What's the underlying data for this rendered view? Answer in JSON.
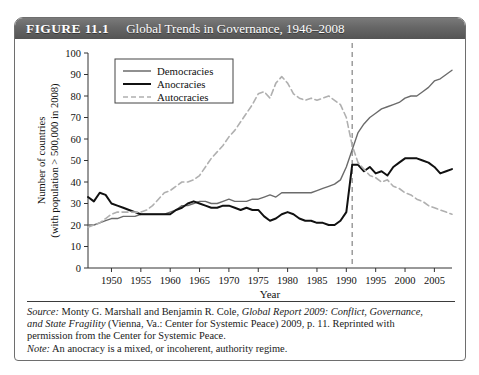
{
  "figure": {
    "number": "FIGURE 11.1",
    "title": "Global Trends in Governance, 1946–2008"
  },
  "caption": {
    "source_label": "Source:",
    "source_part1": " Monty G. Marshall and Benjamin R. Cole, ",
    "source_italic1": "Global Report 2009: Conflict, Governance,",
    "source_italic2": "and State Fragility",
    "source_part2": " (Vienna, Va.: Center for Systemic Peace) 2009, p. 11. Reprinted with",
    "source_part3": "permission from the Center for Systemic Peace.",
    "note_label": "Note:",
    "note_text": " An anocracy is a mixed, or incoherent, authority regime."
  },
  "chart_data": {
    "type": "line",
    "title": "Global Trends in Governance, 1946–2008",
    "xlabel": "Year",
    "ylabel": "Number of countries (with population > 500,000 in 2008)",
    "ylabel_line1": "Number of countries",
    "ylabel_line2": "(with population > 500,000 in 2008)",
    "xlim": [
      1946,
      2008
    ],
    "ylim": [
      0,
      100
    ],
    "yticks": [
      0,
      10,
      20,
      30,
      40,
      50,
      60,
      70,
      80,
      90,
      100
    ],
    "xticks": [
      1950,
      1955,
      1960,
      1965,
      1970,
      1975,
      1980,
      1985,
      1990,
      1995,
      2000,
      2005
    ],
    "grid": false,
    "legend_position": "top-left",
    "annotations": [
      {
        "type": "vline",
        "x": 1991,
        "style": "dashed",
        "color": "#8c8c8c"
      }
    ],
    "x": [
      1946,
      1947,
      1948,
      1949,
      1950,
      1951,
      1952,
      1953,
      1954,
      1955,
      1956,
      1957,
      1958,
      1959,
      1960,
      1961,
      1962,
      1963,
      1964,
      1965,
      1966,
      1967,
      1968,
      1969,
      1970,
      1971,
      1972,
      1973,
      1974,
      1975,
      1976,
      1977,
      1978,
      1979,
      1980,
      1981,
      1982,
      1983,
      1984,
      1985,
      1986,
      1987,
      1988,
      1989,
      1990,
      1991,
      1992,
      1993,
      1994,
      1995,
      1996,
      1997,
      1998,
      1999,
      2000,
      2001,
      2002,
      2003,
      2004,
      2005,
      2006,
      2007,
      2008
    ],
    "series": [
      {
        "name": "Democracies",
        "color": "#6b6b6b",
        "style": "solid",
        "width": 1.4,
        "values": [
          20,
          20,
          21,
          22,
          23,
          23,
          24,
          24,
          24,
          25,
          25,
          25,
          25,
          25,
          26,
          27,
          29,
          29,
          30,
          31,
          31,
          30,
          30,
          31,
          32,
          31,
          31,
          31,
          32,
          32,
          33,
          34,
          33,
          35,
          35,
          35,
          35,
          35,
          35,
          36,
          37,
          38,
          39,
          41,
          47,
          55,
          63,
          67,
          70,
          72,
          74,
          75,
          76,
          77,
          79,
          80,
          80,
          82,
          84,
          87,
          88,
          90,
          92
        ]
      },
      {
        "name": "Anocracies",
        "color": "#111111",
        "style": "solid",
        "width": 2.0,
        "values": [
          33,
          31,
          35,
          34,
          30,
          29,
          28,
          27,
          26,
          25,
          25,
          25,
          25,
          25,
          25,
          27,
          28,
          30,
          31,
          30,
          29,
          28,
          28,
          29,
          29,
          28,
          27,
          28,
          27,
          27,
          24,
          22,
          23,
          25,
          26,
          25,
          23,
          22,
          22,
          21,
          21,
          20,
          20,
          22,
          26,
          48,
          48,
          45,
          47,
          44,
          45,
          43,
          47,
          49,
          51,
          51,
          51,
          50,
          49,
          47,
          44,
          45,
          46
        ]
      },
      {
        "name": "Autocracies",
        "color": "#b0b0b0",
        "style": "dashed",
        "width": 1.6,
        "values": [
          19,
          20,
          21,
          23,
          25,
          26,
          26,
          26,
          26,
          26,
          27,
          29,
          32,
          35,
          36,
          38,
          40,
          40,
          41,
          43,
          47,
          51,
          54,
          57,
          61,
          64,
          68,
          72,
          76,
          81,
          82,
          79,
          86,
          89,
          86,
          81,
          79,
          78,
          79,
          78,
          79,
          80,
          78,
          76,
          70,
          57,
          49,
          46,
          43,
          42,
          40,
          41,
          38,
          37,
          35,
          34,
          32,
          31,
          29,
          28,
          27,
          26,
          25
        ]
      }
    ]
  }
}
